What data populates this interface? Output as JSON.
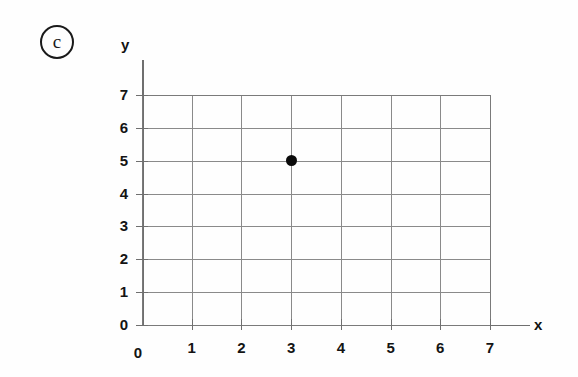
{
  "part_label": {
    "letter": "c",
    "shape": "circle"
  },
  "axes": {
    "x_name": "x",
    "y_name": "y"
  },
  "chart_data": {
    "type": "scatter",
    "title": "",
    "subtitle": "",
    "xlabel": "x",
    "ylabel": "y",
    "xlim": [
      0,
      7
    ],
    "ylim": [
      0,
      7
    ],
    "xticks": [
      "0",
      "1",
      "2",
      "3",
      "4",
      "5",
      "6",
      "7"
    ],
    "yticks": [
      "0",
      "1",
      "2",
      "3",
      "4",
      "5",
      "6",
      "7"
    ],
    "xtick_values": [
      0,
      1,
      2,
      3,
      4,
      5,
      6,
      7
    ],
    "ytick_values": [
      0,
      1,
      2,
      3,
      4,
      5,
      6,
      7
    ],
    "grid": true,
    "grid_color": "#8a8a8a",
    "axis_color": "#6f6f6f",
    "legend": null,
    "legend_position": "none",
    "points": [
      {
        "x": 3,
        "y": 5,
        "color": "#0a0a0a",
        "label": ""
      }
    ],
    "series": [
      {
        "name": "plotted point",
        "x": [
          3
        ],
        "y": [
          5
        ],
        "marker": "filled-circle",
        "color": "#0a0a0a"
      }
    ],
    "annotations": []
  }
}
